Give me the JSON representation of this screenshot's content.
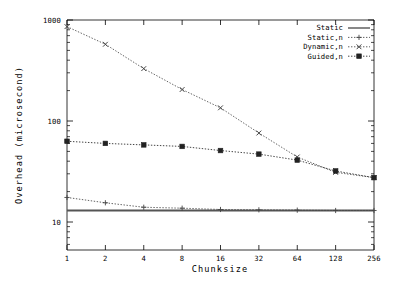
{
  "chart_data": {
    "type": "line",
    "title": "",
    "subtitle": "",
    "xlabel": "Chunksize",
    "ylabel": "Overhead (microsecond)",
    "xscale": "log2",
    "yscale": "log10",
    "x": [
      1,
      2,
      4,
      8,
      16,
      32,
      64,
      128,
      256
    ],
    "xticklabels": [
      "1",
      "2",
      "4",
      "8",
      "16",
      "32",
      "64",
      "128",
      "256"
    ],
    "yticklabels": [
      "1000",
      "100",
      "10"
    ],
    "ytickvalues": [
      1000,
      100,
      10
    ],
    "ylim": [
      5.5,
      1250
    ],
    "xlim": [
      1,
      256
    ],
    "grid": false,
    "legend_position": "top-right",
    "series": [
      {
        "name": "Static",
        "style": "solid",
        "marker": "none",
        "color": "#555555",
        "constant": 13,
        "values": [
          13,
          13,
          13,
          13,
          13,
          13,
          13,
          13,
          13
        ]
      },
      {
        "name": "Static,n",
        "style": "dotted",
        "marker": "plus",
        "color": "#444444",
        "values": [
          17.5,
          15.5,
          14.0,
          13.7,
          13.3,
          13.2,
          13.1,
          13.0,
          13.0
        ]
      },
      {
        "name": "Dynamic,n",
        "style": "dotted",
        "marker": "cross",
        "color": "#444444",
        "values": [
          860,
          575,
          330,
          205,
          135,
          76,
          44,
          31,
          27.5
        ]
      },
      {
        "name": "Guided,n",
        "style": "dotted",
        "marker": "square",
        "color": "#222222",
        "values": [
          63,
          60,
          58,
          56,
          51,
          47,
          41,
          32,
          27.5
        ]
      }
    ]
  },
  "legend": {
    "entries": [
      {
        "label": "Static"
      },
      {
        "label": "Static,n"
      },
      {
        "label": "Dynamic,n"
      },
      {
        "label": "Guided,n"
      }
    ]
  }
}
